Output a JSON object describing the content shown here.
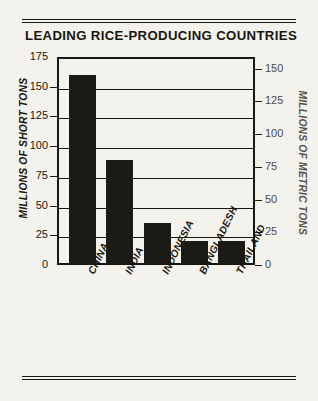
{
  "chart_data": {
    "type": "bar",
    "title": "LEADING RICE-PRODUCING COUNTRIES",
    "categories": [
      "CHINA",
      "INDIA",
      "INDONESIA",
      "BANGLADESH",
      "THAILAND"
    ],
    "values": [
      160,
      88,
      35,
      20,
      20
    ],
    "xlabel": "",
    "ylabel": "MILLIONS OF SHORT TONS",
    "ylabel_right": "MILLIONS OF METRIC TONS",
    "ylim": [
      0,
      175
    ],
    "ylim_right": [
      0,
      159
    ],
    "yticks": [
      0,
      25,
      50,
      75,
      100,
      125,
      150,
      175
    ],
    "yticks_right": [
      0,
      25,
      50,
      75,
      100,
      125,
      150
    ],
    "ytick_labels": [
      "0",
      "25",
      "50",
      "75",
      "100",
      "125",
      "150",
      "175"
    ],
    "ytick_labels_right": [
      "0",
      "25",
      "50",
      "75",
      "100",
      "125",
      "150"
    ],
    "grid": true,
    "legend": null,
    "bar_color": "#1b1a14",
    "frame_color": "#17160f",
    "background_color": "#f3f2ed"
  }
}
